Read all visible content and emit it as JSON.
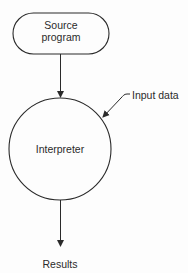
{
  "diagram": {
    "type": "flowchart",
    "nodes": {
      "source": {
        "line1": "Source",
        "line2": "program",
        "shape": "rounded-terminator"
      },
      "interpreter": {
        "label": "Interpreter",
        "shape": "circle"
      }
    },
    "labels": {
      "input": "Input data",
      "output": "Results"
    },
    "edges": [
      {
        "from": "Source program",
        "to": "Interpreter"
      },
      {
        "from": "Input data",
        "to": "Interpreter"
      },
      {
        "from": "Interpreter",
        "to": "Results"
      }
    ],
    "colors": {
      "stroke": "#2a2a2a",
      "background": "#fdfdfd"
    }
  }
}
